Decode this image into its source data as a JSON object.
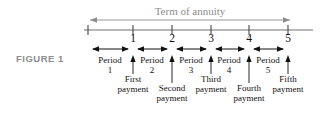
{
  "figure": {
    "caption": "FIGURE 1",
    "term_label": "Term of annuity",
    "colors": {
      "ink": "#111111",
      "gray": "#8d8d8d",
      "background": "#ffffff"
    }
  },
  "timeline": {
    "ticks": [
      {
        "label": "",
        "x": 88
      },
      {
        "label": "1",
        "x": 133
      },
      {
        "label": "2",
        "x": 172
      },
      {
        "label": "3",
        "x": 211
      },
      {
        "label": "4",
        "x": 249
      },
      {
        "label": "5",
        "x": 288
      }
    ],
    "axis": {
      "x_start": 84,
      "x_end": 313,
      "y": 30
    },
    "term_arrow": {
      "x_start": 90,
      "x_end": 290,
      "y": 20
    }
  },
  "periods": [
    {
      "word": "Period",
      "number": "1",
      "center": 110,
      "arrow_start": 92,
      "arrow_end": 129
    },
    {
      "word": "Period",
      "number": "2",
      "center": 152,
      "arrow_start": 137,
      "arrow_end": 168
    },
    {
      "word": "Period",
      "number": "3",
      "center": 191,
      "arrow_start": 176,
      "arrow_end": 207
    },
    {
      "word": "Period",
      "number": "4",
      "center": 229,
      "arrow_start": 215,
      "arrow_end": 245
    },
    {
      "word": "Period",
      "number": "5",
      "center": 268,
      "arrow_start": 253,
      "arrow_end": 284
    }
  ],
  "payments": [
    {
      "ordinal": "First",
      "word": "payment",
      "x": 133,
      "row": "high"
    },
    {
      "ordinal": "Second",
      "word": "payment",
      "x": 172,
      "row": "low"
    },
    {
      "ordinal": "Third",
      "word": "payment",
      "x": 211,
      "row": "high"
    },
    {
      "ordinal": "Fourth",
      "word": "payment",
      "x": 249,
      "row": "low"
    },
    {
      "ordinal": "Fifth",
      "word": "payment",
      "x": 288,
      "row": "high"
    }
  ]
}
